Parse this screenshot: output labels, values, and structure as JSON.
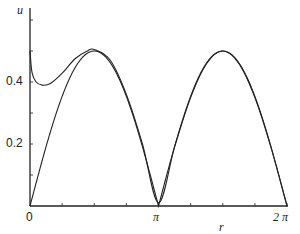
{
  "chart_data": {
    "type": "line",
    "title": "",
    "xlabel": "r",
    "ylabel": "u",
    "xlim": [
      0,
      6.2832
    ],
    "ylim": [
      0,
      0.62
    ],
    "grid": false,
    "legend": "none",
    "x_ticks": [
      {
        "value": 0,
        "label": "0"
      },
      {
        "value": 3.1416,
        "label": "π"
      },
      {
        "value": 6.2832,
        "label": "2 π"
      }
    ],
    "y_ticks": [
      {
        "value": 0.2,
        "label": "0.2"
      },
      {
        "value": 0.4,
        "label": "0.4"
      }
    ],
    "series": [
      {
        "name": "curve-a (|sin r|/2)",
        "x": [
          0,
          0.393,
          0.785,
          1.178,
          1.571,
          1.963,
          2.356,
          2.749,
          3.1416,
          3.534,
          3.927,
          4.32,
          4.712,
          5.105,
          5.498,
          5.89,
          6.2832
        ],
        "y": [
          0,
          0.19,
          0.35,
          0.46,
          0.5,
          0.46,
          0.35,
          0.19,
          0,
          0.19,
          0.35,
          0.46,
          0.5,
          0.46,
          0.35,
          0.19,
          0
        ]
      },
      {
        "name": "curve-b (singular near r=0)",
        "x": [
          0.0,
          0.05,
          0.15,
          0.3,
          0.5,
          0.8,
          1.1,
          1.4,
          1.571,
          1.963,
          2.356,
          2.749,
          3.1416,
          3.534,
          3.927,
          4.32,
          4.712,
          5.105,
          5.498,
          5.89,
          6.2832
        ],
        "y": [
          0.5,
          0.43,
          0.4,
          0.39,
          0.395,
          0.43,
          0.475,
          0.5,
          0.505,
          0.47,
          0.36,
          0.2,
          0.01,
          0.19,
          0.35,
          0.46,
          0.5,
          0.46,
          0.35,
          0.19,
          0
        ]
      }
    ]
  },
  "axes": {
    "x_label": "r",
    "y_label": "u",
    "x_tick_labels": [
      "0",
      "π",
      "2 π"
    ],
    "y_tick_labels": [
      "0.2",
      "0.4"
    ]
  }
}
